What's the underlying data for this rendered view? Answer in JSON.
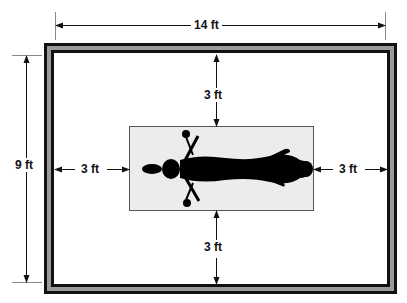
{
  "diagram": {
    "room": {
      "width_label": "14 ft",
      "height_label": "9 ft"
    },
    "clearances": {
      "top": "3 ft",
      "bottom": "3 ft",
      "left": "3 ft",
      "right": "3 ft"
    },
    "colors": {
      "frame_dark": "#111111",
      "frame_band": "#9a9a9a",
      "bed_fill": "#ececec",
      "figure": "#000000"
    }
  }
}
